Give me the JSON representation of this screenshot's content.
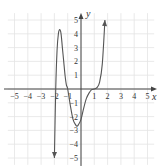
{
  "chart_data": {
    "type": "line",
    "title": "",
    "xlabel": "x",
    "ylabel": "y",
    "xlim": [
      -5.5,
      5.5
    ],
    "ylim": [
      -5.5,
      5.5
    ],
    "grid": true,
    "x_ticks": [
      "-5",
      "-4",
      "-3",
      "-2",
      "-1",
      "1",
      "2",
      "3",
      "4",
      "5"
    ],
    "y_ticks": [
      "5",
      "4",
      "3",
      "2",
      "1",
      "-1",
      "-2",
      "-3",
      "-4",
      "-5"
    ],
    "series": [
      {
        "name": "f(x)",
        "x": [
          -2.0,
          -1.9,
          -1.8,
          -1.7,
          -1.6,
          -1.5,
          -1.4,
          -1.3,
          -1.2,
          -1.1,
          -1.0,
          -0.8,
          -0.6,
          -0.4,
          -0.3,
          -0.2,
          0.0,
          0.2,
          0.4,
          0.6,
          0.8,
          1.0,
          1.2,
          1.4,
          1.6,
          1.8
        ],
        "y": [
          -5.0,
          0.0,
          2.8,
          4.0,
          4.3,
          4.0,
          3.0,
          2.0,
          1.0,
          0.3,
          0.0,
          -1.2,
          -2.2,
          -2.6,
          -2.7,
          -2.6,
          -2.2,
          -1.4,
          -0.7,
          -0.3,
          -0.05,
          0.0,
          0.1,
          0.5,
          1.8,
          5.0
        ],
        "end_arrows": [
          "down-left",
          "up-right"
        ]
      }
    ],
    "color": "#555555"
  }
}
